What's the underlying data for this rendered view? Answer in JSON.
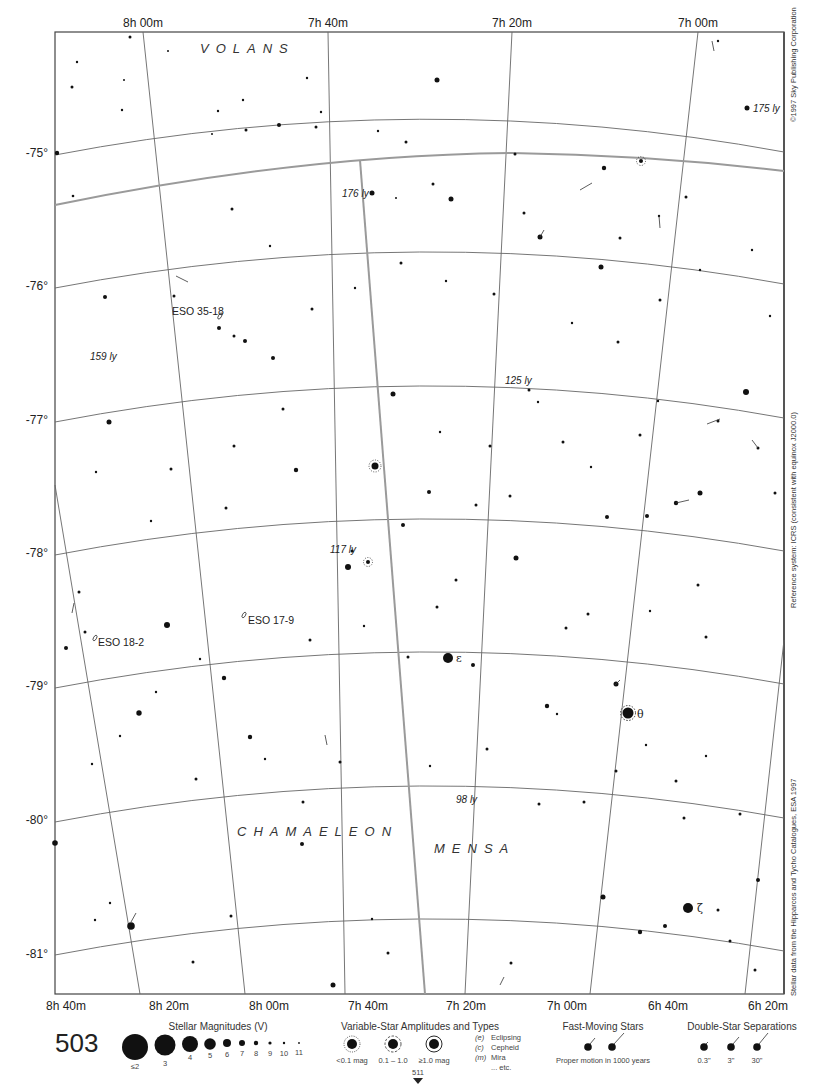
{
  "chart": {
    "page_number": "503",
    "ra_top_labels": [
      "8h 00m",
      "7h 40m",
      "7h 20m",
      "7h 00m"
    ],
    "ra_bottom_labels": [
      "8h 40m",
      "8h 20m",
      "8h 00m",
      "7h 40m",
      "7h 20m",
      "7h 00m",
      "6h 40m",
      "6h 20m"
    ],
    "dec_labels": [
      "-75°",
      "-76°",
      "-77°",
      "-78°",
      "-79°",
      "-80°",
      "-81°"
    ],
    "constellations": [
      "VOLANS",
      "CHAMAELEON",
      "MENSA"
    ],
    "distance_labels": [
      "176 ly",
      "175 ly",
      "159 ly",
      "125 ly",
      "117 ly",
      "98 ly"
    ],
    "deep_sky_objects": [
      "ESO 35-18",
      "ESO 17-9",
      "ESO 18-2"
    ],
    "greek_labels": {
      "epsilon": "ε",
      "theta": "θ",
      "zeta": "ζ"
    },
    "side_notes": {
      "copyright": "©1997 Sky Publishing Corporation",
      "reference": "Reference system: ICRS (consistent with equinox J2000.0)",
      "source": "Stellar data from the Hipparcos and Tycho Catalogues, ESA 1997"
    },
    "adjacent_chart": "511"
  },
  "legend": {
    "magnitudes": {
      "title": "Stellar Magnitudes (V)",
      "labels": [
        "≤2",
        "3",
        "4",
        "5",
        "6",
        "7",
        "8",
        "9",
        "10",
        "11"
      ]
    },
    "variables": {
      "title": "Variable-Star Amplitudes and Types",
      "amplitudes": [
        "<0.1 mag",
        "0.1 – 1.0",
        "≥1.0 mag"
      ],
      "types": [
        {
          "code": "(e)",
          "name": "Eclipsing"
        },
        {
          "code": "(c)",
          "name": "Cepheid"
        },
        {
          "code": "(m)",
          "name": "Mira"
        },
        {
          "code": "",
          "name": "... etc."
        }
      ]
    },
    "fast_moving": {
      "title": "Fast-Moving Stars",
      "caption": "Proper motion in 1000 years"
    },
    "double_stars": {
      "title": "Double-Star Separations",
      "labels": [
        "0.3\"",
        "3\"",
        "30\""
      ]
    }
  },
  "colors": {
    "ink": "#111111",
    "grid": "#555555",
    "boundary": "#9a9a9a",
    "background": "#ffffff"
  }
}
